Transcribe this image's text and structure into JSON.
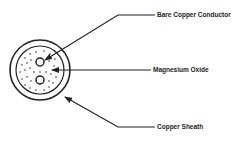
{
  "diagram": {
    "labels": {
      "conductor": "Bare Copper Conductor",
      "insulation": "Magnesium Oxide",
      "sheath": "Copper Sheath"
    },
    "colors": {
      "ink": "#222222",
      "background": "#ffffff"
    }
  }
}
